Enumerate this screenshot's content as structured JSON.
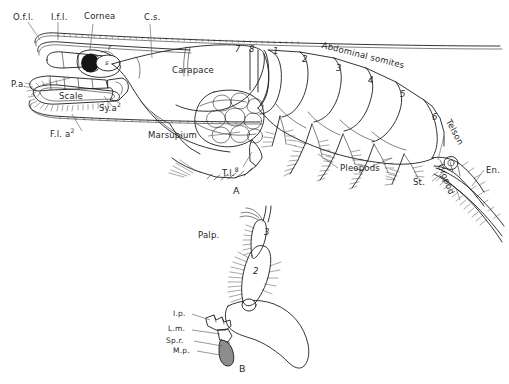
{
  "figure": {
    "caption_a": "A",
    "caption_b": "B",
    "background_color": "#ffffff",
    "ink_color": "#1d1d1d"
  },
  "figure_a": {
    "name": "lateral view of mysid shrimp",
    "labels": {
      "outer_flagellum": "O.f.l.",
      "inner_flagellum": "I.f.l.",
      "cornea": "Cornea",
      "cervical_sulcus": "C.s.",
      "peduncle_antennule": "P.a.",
      "scale": "Scale",
      "sympod_antenna2": "Sy.a",
      "sympod_antenna2_sup": "2",
      "flagellum_antenna2": "F.l. a",
      "flagellum_antenna2_sup": "2",
      "carapace": "Carapace",
      "marsupium": "Marsupium",
      "thoracic_limb_8": "T.l.",
      "thoracic_limb_8_sup": "8",
      "abdominal_somites": "Abdominal somites",
      "pleopods": "Pleopods",
      "telson": "Telson",
      "uropod": "Uropod",
      "statocyst": "St.",
      "endopod": "En.",
      "eye_r": "r",
      "eye_s": "s"
    },
    "somite_numbers": [
      "7",
      "8",
      "1",
      "2",
      "3",
      "4",
      "5",
      "6"
    ]
  },
  "figure_b": {
    "name": "mandible with palp",
    "labels": {
      "palp": "Palp.",
      "incisor_process": "I.p.",
      "lacinia_mobilis": "L.m.",
      "spine_row": "Sp.r.",
      "molar_process": "M.p."
    },
    "palp_segments": [
      "3",
      "2"
    ]
  }
}
